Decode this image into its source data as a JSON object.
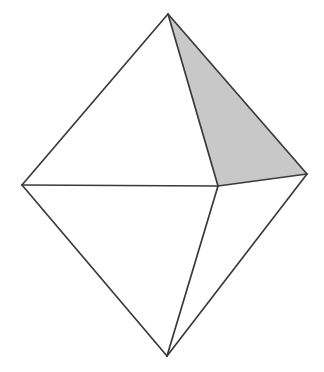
{
  "figure": {
    "name": "octahedron-wireframe",
    "canvas": {
      "width": 324,
      "height": 372,
      "background": "#ffffff"
    },
    "style": {
      "edge_color": "#3a3a3a",
      "edge_width": 1.7,
      "shaded_face_fill": "#c8c8c8",
      "unshaded_face_fill": "#ffffff"
    },
    "vertices": [
      {
        "id": "top",
        "label": "top apex",
        "x": 168,
        "y": 14
      },
      {
        "id": "left",
        "label": "left vertex",
        "x": 22,
        "y": 185
      },
      {
        "id": "right",
        "label": "right vertex",
        "x": 307,
        "y": 174
      },
      {
        "id": "center",
        "label": "front vertex",
        "x": 218,
        "y": 186
      },
      {
        "id": "bottom",
        "label": "bottom apex",
        "x": 167,
        "y": 356
      }
    ],
    "faces": [
      {
        "id": "upper-left-face",
        "label": "upper left face",
        "vertices": [
          "top",
          "left",
          "center"
        ],
        "points": "168,14 22,185 218,186",
        "fill": "#ffffff",
        "shaded": false
      },
      {
        "id": "upper-right-face",
        "label": "upper right shaded face",
        "vertices": [
          "top",
          "center",
          "right"
        ],
        "points": "168,14 218,186 307,174",
        "fill": "#c8c8c8",
        "shaded": true
      },
      {
        "id": "lower-left-face",
        "label": "lower left face",
        "vertices": [
          "left",
          "center",
          "bottom"
        ],
        "points": "22,185 218,186 167,356",
        "fill": "#ffffff",
        "shaded": false
      },
      {
        "id": "lower-right-face",
        "label": "lower right face",
        "vertices": [
          "center",
          "right",
          "bottom"
        ],
        "points": "218,186 307,174 167,356",
        "fill": "#ffffff",
        "shaded": false
      }
    ],
    "edges": [
      {
        "id": "edge-top-left",
        "label": "top to left",
        "x1": 168,
        "y1": 14,
        "x2": 22,
        "y2": 185
      },
      {
        "id": "edge-top-right",
        "label": "top to right",
        "x1": 168,
        "y1": 14,
        "x2": 307,
        "y2": 174
      },
      {
        "id": "edge-top-center",
        "label": "top to front",
        "x1": 168,
        "y1": 14,
        "x2": 218,
        "y2": 186
      },
      {
        "id": "edge-left-center",
        "label": "left to front",
        "x1": 22,
        "y1": 185,
        "x2": 218,
        "y2": 186
      },
      {
        "id": "edge-center-right",
        "label": "front to right",
        "x1": 218,
        "y1": 186,
        "x2": 307,
        "y2": 174
      },
      {
        "id": "edge-left-bottom",
        "label": "left to bottom",
        "x1": 22,
        "y1": 185,
        "x2": 167,
        "y2": 356
      },
      {
        "id": "edge-center-bottom",
        "label": "front to bottom",
        "x1": 218,
        "y1": 186,
        "x2": 167,
        "y2": 356
      },
      {
        "id": "edge-right-bottom",
        "label": "right to bottom",
        "x1": 307,
        "y1": 174,
        "x2": 167,
        "y2": 356
      }
    ]
  }
}
